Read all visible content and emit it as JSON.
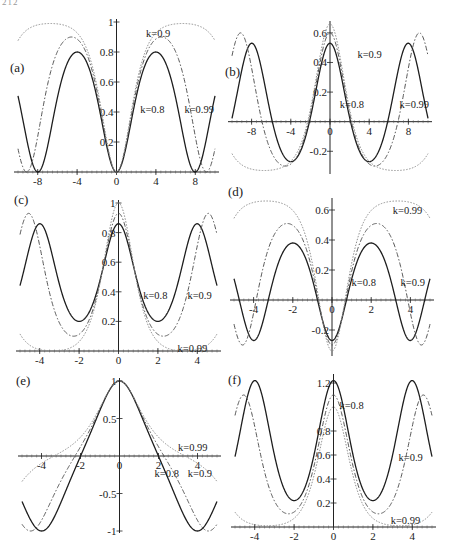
{
  "page": {
    "number": "212"
  },
  "styles": {
    "0.8": {
      "stroke": "#1e1e1e",
      "dash": "",
      "width": 1.3
    },
    "0.9": {
      "stroke": "#555555",
      "dash": "5 2 1.5 2",
      "width": 1.0
    },
    "0.99": {
      "stroke": "#8a8a8a",
      "dash": "1.5 1.5",
      "width": 1.0
    }
  },
  "chart_data": [
    {
      "id": "a",
      "type": "line",
      "panel_label": "(a)",
      "title": "",
      "xlabel": "",
      "ylabel": "",
      "xlim": [
        -10,
        10
      ],
      "ylim": [
        0,
        1
      ],
      "xticks": [
        {
          "v": -8,
          "t": "-8"
        },
        {
          "v": -4,
          "t": "-4"
        },
        {
          "v": 0,
          "t": "0"
        },
        {
          "v": 4,
          "t": "4"
        },
        {
          "v": 8,
          "t": "8"
        }
      ],
      "yticks": [
        {
          "v": 0.2,
          "t": "0.2"
        },
        {
          "v": 0.4,
          "t": "0.4"
        },
        {
          "v": 0.6,
          "t": "0.6"
        },
        {
          "v": 0.8,
          "t": "0.8"
        },
        {
          "v": 1,
          "t": "1"
        }
      ],
      "series": [
        {
          "name": "k=0.8",
          "k": 0.8,
          "form": "lo+(hi-lo)*sn^2(s*x,k)",
          "s": 0.5,
          "lo": 0,
          "hi": 0.8,
          "label_at": [
            2.4,
            0.42
          ]
        },
        {
          "name": "k=0.9",
          "k": 0.9,
          "form": "lo+(hi-lo)*sn^2(s*x,k)",
          "s": 0.5,
          "lo": 0,
          "hi": 0.9,
          "label_at": [
            3.0,
            0.93
          ]
        },
        {
          "name": "k=0.99",
          "k": 0.99,
          "form": "lo+(hi-lo)*sn^2(s*x,k)",
          "s": 0.5,
          "lo": 0,
          "hi": 0.99,
          "label_at": [
            6.9,
            0.42
          ]
        }
      ]
    },
    {
      "id": "b",
      "type": "line",
      "panel_label": "(b)",
      "title": "",
      "xlabel": "",
      "ylabel": "",
      "xlim": [
        -10,
        10
      ],
      "ylim": [
        -0.34,
        0.66
      ],
      "xticks": [
        {
          "v": -8,
          "t": "-8"
        },
        {
          "v": -4,
          "t": "-4"
        },
        {
          "v": 0,
          "t": "0"
        },
        {
          "v": 4,
          "t": "4"
        },
        {
          "v": 8,
          "t": "8"
        }
      ],
      "yticks": [
        {
          "v": -0.2,
          "t": "-0.2"
        },
        {
          "v": 0.2,
          "t": "0.2"
        },
        {
          "v": 0.4,
          "t": "0.4"
        },
        {
          "v": 0.6,
          "t": "0.6"
        }
      ],
      "series": [
        {
          "name": "k=0.8",
          "k": 0.8,
          "form": "hi-(hi-lo)*sn^2(s*x,k)",
          "s": 0.5,
          "lo": -0.27,
          "hi": 0.53,
          "label_at": [
            1.0,
            0.12
          ]
        },
        {
          "name": "k=0.9",
          "k": 0.9,
          "form": "hi-(hi-lo)*sn^2(s*x,k)",
          "s": 0.5,
          "lo": -0.3,
          "hi": 0.6,
          "label_at": [
            2.8,
            0.46
          ]
        },
        {
          "name": "k=0.99",
          "k": 0.99,
          "form": "hi-(hi-lo)*sn^2(s*x,k)",
          "s": 0.5,
          "lo": -0.33,
          "hi": 0.66,
          "label_at": [
            7.1,
            0.12
          ]
        }
      ]
    },
    {
      "id": "c",
      "type": "line",
      "panel_label": "(c)",
      "title": "",
      "xlabel": "",
      "ylabel": "",
      "xlim": [
        -5,
        5
      ],
      "ylim": [
        0,
        1
      ],
      "xticks": [
        {
          "v": -4,
          "t": "-4"
        },
        {
          "v": -2,
          "t": "-2"
        },
        {
          "v": 0,
          "t": "0"
        },
        {
          "v": 2,
          "t": "2"
        },
        {
          "v": 4,
          "t": "4"
        }
      ],
      "yticks": [
        {
          "v": 0.2,
          "t": "0.2"
        },
        {
          "v": 0.4,
          "t": "0.4"
        },
        {
          "v": 0.6,
          "t": "0.6"
        },
        {
          "v": 0.8,
          "t": "0.8"
        },
        {
          "v": 1,
          "t": "1"
        }
      ],
      "series": [
        {
          "name": "k=0.8",
          "k": 0.8,
          "form": "lo+(hi-lo)*cn^2(s*x,k)",
          "s": 1,
          "lo": 0.2,
          "hi": 0.86,
          "label_at": [
            1.25,
            0.38
          ]
        },
        {
          "name": "k=0.9",
          "k": 0.9,
          "form": "lo+(hi-lo)*cn^2(s*x,k)",
          "s": 1,
          "lo": 0.1,
          "hi": 0.93,
          "label_at": [
            3.5,
            0.38
          ]
        },
        {
          "name": "k=0.99",
          "k": 0.99,
          "form": "lo+(hi-lo)*cn^2(s*x,k)",
          "s": 1,
          "lo": 0.0,
          "hi": 1.0,
          "label_at": [
            3.0,
            0.02
          ]
        }
      ]
    },
    {
      "id": "d",
      "type": "line",
      "panel_label": "(d)",
      "title": "",
      "xlabel": "",
      "ylabel": "",
      "xlim": [
        -5,
        5
      ],
      "ylim": [
        -0.36,
        0.66
      ],
      "xticks": [
        {
          "v": -4,
          "t": "-4"
        },
        {
          "v": -2,
          "t": "-2"
        },
        {
          "v": 0,
          "t": "0"
        },
        {
          "v": 2,
          "t": "2"
        },
        {
          "v": 4,
          "t": "4"
        }
      ],
      "yticks": [
        {
          "v": -0.2,
          "t": "-0.2"
        },
        {
          "v": 0.2,
          "t": "0.2"
        },
        {
          "v": 0.4,
          "t": "0.4"
        },
        {
          "v": 0.6,
          "t": "0.6"
        }
      ],
      "series": [
        {
          "name": "k=0.8",
          "k": 0.8,
          "form": "lo+(hi-lo)*sn^2(s*x,k)",
          "s": 1,
          "lo": -0.27,
          "hi": 0.38,
          "label_at": [
            1.0,
            0.12
          ]
        },
        {
          "name": "k=0.9",
          "k": 0.9,
          "form": "lo+(hi-lo)*sn^2(s*x,k)",
          "s": 1,
          "lo": -0.3,
          "hi": 0.51,
          "label_at": [
            3.5,
            0.12
          ]
        },
        {
          "name": "k=0.99",
          "k": 0.99,
          "form": "lo+(hi-lo)*sn^2(s*x,k)",
          "s": 1,
          "lo": -0.34,
          "hi": 0.66,
          "label_at": [
            3.1,
            0.6
          ]
        }
      ]
    },
    {
      "id": "e",
      "type": "line",
      "panel_label": "(e)",
      "title": "",
      "xlabel": "",
      "ylabel": "",
      "xlim": [
        -5,
        5
      ],
      "ylim": [
        -1,
        1
      ],
      "xticks": [
        {
          "v": -4,
          "t": "-4"
        },
        {
          "v": -2,
          "t": "-2"
        },
        {
          "v": 0,
          "t": "0"
        },
        {
          "v": 2,
          "t": "2"
        },
        {
          "v": 4,
          "t": "4"
        }
      ],
      "yticks": [
        {
          "v": -1,
          "t": "-1"
        },
        {
          "v": -0.5,
          "t": "-0.5"
        },
        {
          "v": 0.5,
          "t": "0.5"
        },
        {
          "v": 1,
          "t": "1"
        }
      ],
      "series": [
        {
          "name": "k=0.8",
          "k": 0.8,
          "form": "cn(s*x,k)",
          "s": 1,
          "label_at": [
            1.8,
            -0.22
          ]
        },
        {
          "name": "k=0.9",
          "k": 0.9,
          "form": "cn(s*x,k)",
          "s": 1,
          "label_at": [
            3.5,
            -0.22
          ]
        },
        {
          "name": "k=0.99",
          "k": 0.99,
          "form": "cn(s*x,k)",
          "s": 1,
          "label_at": [
            3.0,
            0.12
          ]
        }
      ]
    },
    {
      "id": "f",
      "type": "line",
      "panel_label": "(f)",
      "title": "",
      "xlabel": "",
      "ylabel": "",
      "xlim": [
        -5,
        5
      ],
      "ylim": [
        0,
        1.25
      ],
      "xticks": [
        {
          "v": -4,
          "t": "-4"
        },
        {
          "v": -2,
          "t": "-2"
        },
        {
          "v": 0,
          "t": "0"
        },
        {
          "v": 2,
          "t": "2"
        },
        {
          "v": 4,
          "t": "4"
        }
      ],
      "yticks": [
        {
          "v": 0.2,
          "t": "0.2"
        },
        {
          "v": 0.4,
          "t": "0.4"
        },
        {
          "v": 0.6,
          "t": "0.6"
        },
        {
          "v": 0.8,
          "t": "0.8"
        },
        {
          "v": 1.2,
          "t": "1.2"
        }
      ],
      "series": [
        {
          "name": "k=0.8",
          "k": 0.8,
          "form": "lo+(hi-lo)*cn^2(s*x,k)",
          "s": 1,
          "lo": 0.22,
          "hi": 1.22,
          "label_at": [
            0.3,
            1.02
          ]
        },
        {
          "name": "k=0.9",
          "k": 0.9,
          "form": "lo+(hi-lo)*cn^2(s*x,k)",
          "s": 1,
          "lo": 0.11,
          "hi": 1.1,
          "label_at": [
            3.3,
            0.58
          ]
        },
        {
          "name": "k=0.99",
          "k": 0.99,
          "form": "lo+(hi-lo)*cn^2(s*x,k)",
          "s": 1,
          "lo": 0.01,
          "hi": 1.0,
          "label_at": [
            2.9,
            0.06
          ]
        }
      ]
    }
  ]
}
